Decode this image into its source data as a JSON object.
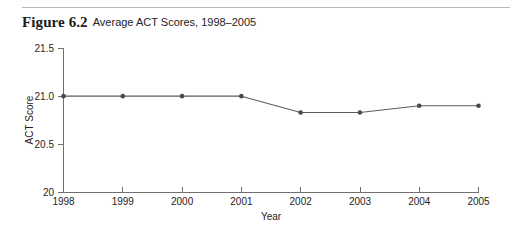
{
  "figure": {
    "label": "Figure 6.2",
    "caption": "Average ACT Scores, 1998–2005"
  },
  "chart_data": {
    "type": "line",
    "title": "Average ACT Scores, 1998–2005",
    "xlabel": "Year",
    "ylabel": "ACT Score",
    "categories": [
      "1998",
      "1999",
      "2000",
      "2001",
      "2002",
      "2003",
      "2004",
      "2005"
    ],
    "values": [
      21.0,
      21.0,
      21.0,
      21.0,
      20.83,
      20.83,
      20.9,
      20.9
    ],
    "series": [
      {
        "name": "Average ACT Score",
        "values": [
          21.0,
          21.0,
          21.0,
          21.0,
          20.83,
          20.83,
          20.9,
          20.9
        ]
      }
    ],
    "x_tick_labels": [
      "1998",
      "1999",
      "2000",
      "2001",
      "2002",
      "2003",
      "2004",
      "2005"
    ],
    "y_tick_labels": [
      "21.5",
      "21.0",
      "20.5",
      "20"
    ],
    "y_tick_values": [
      21.5,
      21.0,
      20.5,
      20.0
    ],
    "ylim": [
      20.0,
      21.5
    ],
    "grid": false,
    "legend": false,
    "line_color": "#5d5d5d",
    "marker_color": "#4a4a4a",
    "axis_color": "#6f6f6f"
  }
}
